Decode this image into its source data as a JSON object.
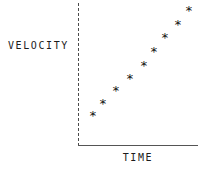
{
  "figure": {
    "width": 204,
    "height": 169,
    "background_color": "#ffffff"
  },
  "axes": {
    "y_axis": {
      "label": "VELOCITY",
      "style": "dashed",
      "color": "#4a4a4a",
      "pixel_x": 78,
      "pixel_top": 3,
      "pixel_bottom": 146
    },
    "x_axis": {
      "label": "TIME",
      "style": "solid",
      "color": "#555555",
      "pixel_y": 145,
      "pixel_left": 78,
      "pixel_right": 198
    }
  },
  "marker": {
    "glyph": "*",
    "name": "asterisk-marker",
    "color": "#101010"
  },
  "chart_data": {
    "type": "scatter",
    "title": "",
    "xlabel": "TIME",
    "ylabel": "VELOCITY",
    "xlim": [
      0,
      10
    ],
    "ylim": [
      0,
      10
    ],
    "grid": false,
    "legend": false,
    "axis_ticks": {
      "x": [],
      "y": []
    },
    "series": [
      {
        "name": "velocity",
        "marker": "*",
        "points": [
          {
            "x": 1.0,
            "y": 2.2,
            "px": 93,
            "py": 113
          },
          {
            "x": 1.9,
            "y": 3.0,
            "px": 103,
            "py": 101
          },
          {
            "x": 3.0,
            "y": 3.9,
            "px": 116,
            "py": 88
          },
          {
            "x": 4.2,
            "y": 4.7,
            "px": 130,
            "py": 76
          },
          {
            "x": 5.4,
            "y": 5.7,
            "px": 144,
            "py": 63
          },
          {
            "x": 6.3,
            "y": 6.6,
            "px": 154,
            "py": 49
          },
          {
            "x": 7.2,
            "y": 7.7,
            "px": 165,
            "py": 35
          },
          {
            "x": 8.3,
            "y": 8.6,
            "px": 178,
            "py": 22
          },
          {
            "x": 9.3,
            "y": 9.5,
            "px": 189,
            "py": 8
          }
        ]
      }
    ]
  }
}
